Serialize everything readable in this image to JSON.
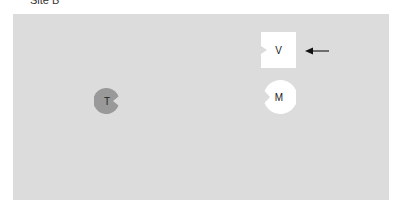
{
  "title": "Site B",
  "board": {
    "background": "#dcdcdc"
  },
  "pieces": [
    {
      "id": "V",
      "label": "V",
      "shape": "square-notched",
      "color": "#ffffff"
    },
    {
      "id": "M",
      "label": "M",
      "shape": "circle-notched",
      "color": "#ffffff"
    },
    {
      "id": "T",
      "label": "T",
      "shape": "circle-notched",
      "color": "#999999"
    }
  ],
  "pointer": {
    "icon": "arrow-left-icon",
    "target": "V"
  }
}
